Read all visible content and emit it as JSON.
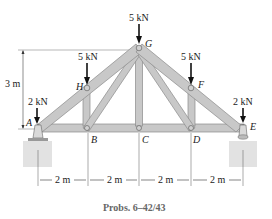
{
  "diagram": {
    "caption": "Probs. 6–42/43",
    "height_label": "3 m",
    "spans": [
      "2 m",
      "2 m",
      "2 m",
      "2 m"
    ],
    "loads": [
      {
        "node": "A",
        "label": "2 kN"
      },
      {
        "node": "H",
        "label": "5 kN"
      },
      {
        "node": "G",
        "label": "5 kN"
      },
      {
        "node": "F",
        "label": "5 kN"
      },
      {
        "node": "E",
        "label": "2 kN"
      }
    ],
    "nodes": {
      "A": "A",
      "B": "B",
      "C": "C",
      "D": "D",
      "E": "E",
      "F": "F",
      "G": "G",
      "H": "H"
    },
    "colors": {
      "member": "#c8c8c8",
      "member_edge": "#8a8a8a",
      "support": "#d9d9d9"
    }
  }
}
